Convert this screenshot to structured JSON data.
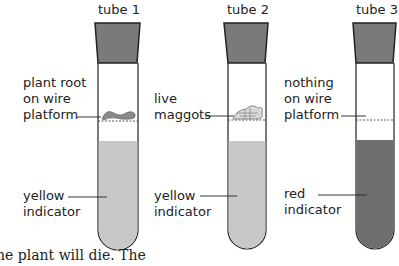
{
  "tubes": [
    {
      "title": "tube 1",
      "contents_label": "plant root\non wire\nplatform",
      "indicator_label": "yellow\nindicator",
      "indicator_color": "#c8c8c8"
    },
    {
      "title": "tube 2",
      "contents_label": "live\nmaggots",
      "indicator_label": "yellow\nindicator",
      "indicator_color": "#c8c8c8"
    },
    {
      "title": "tube 3",
      "contents_label": "nothing\non wire\nplatform",
      "indicator_label": "red\nindicator",
      "indicator_color": "#6e6e6e"
    }
  ],
  "colors": {
    "stopper": "#7a7a7a",
    "outline": "#222222"
  },
  "footer_text": "he plant will die. The"
}
